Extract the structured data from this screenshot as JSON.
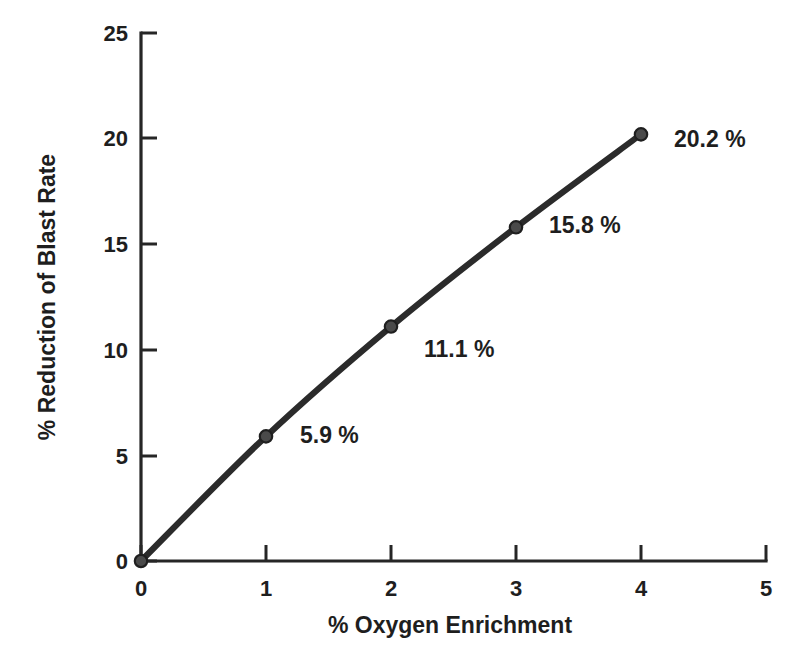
{
  "chart_data": {
    "type": "line",
    "title": "",
    "subtitle": "",
    "xlabel": "% Oxygen Enrichment",
    "ylabel": "% Reduction of Blast Rate",
    "xlim": [
      0,
      5
    ],
    "ylim": [
      0,
      25
    ],
    "xticks": [
      "0",
      "1",
      "2",
      "3",
      "4",
      "5"
    ],
    "xtick_values": [
      0,
      1,
      2,
      3,
      4,
      5
    ],
    "yticks": [
      "0",
      "5",
      "10",
      "15",
      "20",
      "25"
    ],
    "ytick_values": [
      0,
      5,
      10,
      15,
      20,
      25
    ],
    "grid": false,
    "legend": false,
    "legend_position": "none",
    "x": [
      0,
      1,
      2,
      3,
      4
    ],
    "values": [
      0,
      5.9,
      11.1,
      15.8,
      20.2
    ],
    "series": [
      {
        "name": "% Reduction of Blast Rate",
        "x": [
          0,
          1,
          2,
          3,
          4
        ],
        "values": [
          0,
          5.9,
          11.1,
          15.8,
          20.2
        ],
        "color": "#2b2b2b",
        "marker": "circle"
      }
    ],
    "annotations": [
      {
        "text": "5.9 %",
        "x": 1,
        "y": 5.9
      },
      {
        "text": "11.1 %",
        "x": 2,
        "y": 11.1
      },
      {
        "text": "15.8 %",
        "x": 3,
        "y": 15.8
      },
      {
        "text": "20.2 %",
        "x": 4,
        "y": 20.2
      }
    ],
    "colors": {
      "line": "#2b2b2b",
      "marker_fill": "#4a4a4a",
      "marker_edge": "#1f1f1f",
      "axis": "#262626",
      "text": "#1e1e1e",
      "background": "#ffffff"
    }
  }
}
